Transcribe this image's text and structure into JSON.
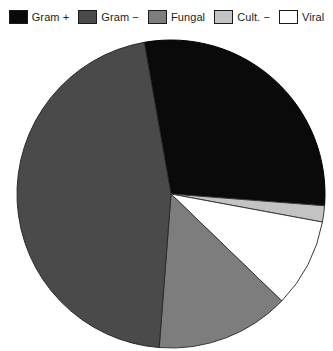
{
  "legend": {
    "position": "top",
    "items": [
      {
        "label": "Gram +",
        "color": "#0a0a0a",
        "key": "gram-plus"
      },
      {
        "label": "Gram −",
        "color": "#4a4a4a",
        "key": "gram-minus"
      },
      {
        "label": "Fungal",
        "color": "#7d7d7d",
        "key": "fungal"
      },
      {
        "label": "Cult. −",
        "color": "#c3c3c3",
        "key": "cult-minus"
      },
      {
        "label": "Viral",
        "color": "#ffffff",
        "key": "viral"
      }
    ]
  },
  "chart_data": {
    "type": "pie",
    "title": "",
    "subtitle": "",
    "xlabel": "",
    "ylabel": "",
    "grid": false,
    "legend_position": "top",
    "start_angle_deg": -10,
    "direction": "clockwise",
    "center": {
      "x": 171,
      "y": 160
    },
    "radius": 154,
    "categories": [
      "Gram +",
      "Gram −",
      "Fungal",
      "Cult. −",
      "Viral"
    ],
    "values": [
      29.0,
      46.0,
      14.0,
      1.7,
      9.3
    ],
    "units": "percent",
    "slices": [
      {
        "label": "Gram +",
        "value": 29.0,
        "angle_deg": 104.4,
        "color": "#0a0a0a",
        "edge": "#000000"
      },
      {
        "label": "Cult. −",
        "value": 1.7,
        "angle_deg": 6.1,
        "color": "#c3c3c3",
        "edge": "#3a3a3a"
      },
      {
        "label": "Viral",
        "value": 9.3,
        "angle_deg": 33.5,
        "color": "#ffffff",
        "edge": "#3a3a3a"
      },
      {
        "label": "Fungal",
        "value": 14.0,
        "angle_deg": 50.4,
        "color": "#7d7d7d",
        "edge": "#3a3a3a"
      },
      {
        "label": "Gram −",
        "value": 46.0,
        "angle_deg": 165.6,
        "color": "#4a4a4a",
        "edge": "#2a2a2a"
      }
    ]
  }
}
